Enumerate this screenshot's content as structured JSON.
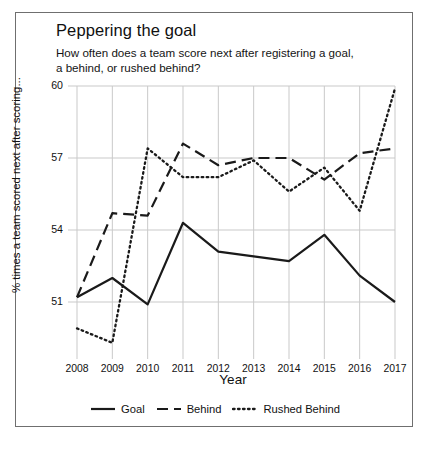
{
  "chart_data": {
    "type": "line",
    "title": "Peppering the goal",
    "subtitle": "How often does a team score next after registering a goal, a behind, or rushed behind?",
    "xlabel": "Year",
    "ylabel": "% times a team scored next after scoring...",
    "x": [
      2008,
      2009,
      2010,
      2011,
      2012,
      2013,
      2014,
      2015,
      2016,
      2017
    ],
    "categories": [
      "2008",
      "2009",
      "2010",
      "2011",
      "2012",
      "2013",
      "2014",
      "2015",
      "2016",
      "2017"
    ],
    "xlim": [
      2008,
      2017
    ],
    "ylim": [
      49,
      60
    ],
    "yticks": [
      51,
      54,
      57,
      60
    ],
    "ytick_labels": [
      "51",
      "54",
      "57",
      "60"
    ],
    "grid": "both",
    "legend_position": "bottom",
    "series": [
      {
        "name": "Goal",
        "style": "solid",
        "color": "#1a1a1a",
        "values": [
          51.2,
          52.0,
          50.9,
          54.3,
          53.1,
          52.9,
          52.7,
          53.8,
          52.1,
          51.0
        ]
      },
      {
        "name": "Behind",
        "style": "dashed",
        "color": "#1a1a1a",
        "values": [
          51.2,
          54.7,
          54.6,
          57.6,
          56.7,
          57.0,
          57.0,
          56.1,
          57.2,
          57.4
        ]
      },
      {
        "name": "Rushed Behind",
        "style": "dotted",
        "color": "#1a1a1a",
        "values": [
          49.9,
          49.3,
          57.4,
          56.2,
          56.2,
          56.9,
          55.6,
          56.6,
          54.8,
          59.9
        ]
      }
    ]
  },
  "legend": {
    "items": [
      {
        "label": "Goal",
        "style": "solid"
      },
      {
        "label": "Behind",
        "style": "dashed"
      },
      {
        "label": "Rushed Behind",
        "style": "dotted"
      }
    ]
  },
  "colors": {
    "ink": "#1a1a1a",
    "grid": "#c9c9c9",
    "frame": "#6f6f6f",
    "background": "#ffffff"
  }
}
